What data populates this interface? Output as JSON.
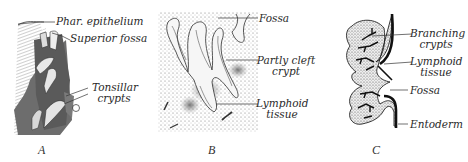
{
  "figure": {
    "panels": [
      {
        "id": "A",
        "letter": "A",
        "labels": {
          "phar_epithelium": "Phar. epithelium",
          "superior_fossa": "Superior fossa",
          "tonsillar_line1": "Tonsillar",
          "tonsillar_line2": "crypts"
        }
      },
      {
        "id": "B",
        "letter": "B",
        "labels": {
          "fossa": "Fossa",
          "partly_cleft_line1": "Partly cleft",
          "partly_cleft_line2": "crypt",
          "lymphoid_line1": "Lymphoid",
          "lymphoid_line2": "tissue"
        }
      },
      {
        "id": "C",
        "letter": "C",
        "labels": {
          "branching_line1": "Branching",
          "branching_line2": "crypts",
          "lymphoid_line1": "Lymphoid",
          "lymphoid_line2": "tissue",
          "fossa": "Fossa",
          "entoderm": "Entoderm"
        }
      }
    ]
  }
}
